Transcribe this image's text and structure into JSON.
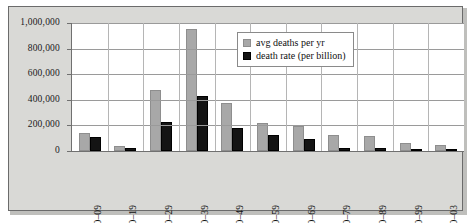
{
  "chart_data": {
    "type": "bar",
    "title": "",
    "subtitle": "",
    "xlabel": "",
    "ylabel": "",
    "grid": true,
    "legend_position": "top-right",
    "ylim": [
      0,
      1000000
    ],
    "ytick_labels": [
      "1,000,000",
      "800,000",
      "600,000",
      "400,000",
      "200,000",
      "0"
    ],
    "ytick_values": [
      1000000,
      800000,
      600000,
      400000,
      200000,
      0
    ],
    "categories": [
      "1900–09",
      "1910–19",
      "1920–29",
      "1930–39",
      "1940–49",
      "1950–59",
      "1960–69",
      "1970–79",
      "1980–89",
      "1990–99",
      "2000–03"
    ],
    "series": [
      {
        "name": "avg deaths per yr",
        "color": "#a8a8a8",
        "values": [
          140000,
          40000,
          480000,
          950000,
          375000,
          220000,
          195000,
          125000,
          120000,
          60000,
          45000
        ]
      },
      {
        "name": "death rate (per billion)",
        "color": "#141414",
        "values": [
          110000,
          25000,
          225000,
          430000,
          180000,
          125000,
          90000,
          25000,
          22000,
          8000,
          8000
        ]
      }
    ]
  },
  "legend": {
    "items": [
      {
        "label": "avg deaths per yr",
        "color": "#a8a8a8"
      },
      {
        "label": "death rate (per billion)",
        "color": "#141414"
      }
    ]
  },
  "colors": {
    "panel_background": "#d9d9d6",
    "plot_background": "#ffffff",
    "frame_border": "#6b6b6b",
    "gridline": "#9a9a9a",
    "series_avg": "#a8a8a8",
    "series_rate": "#141414"
  }
}
